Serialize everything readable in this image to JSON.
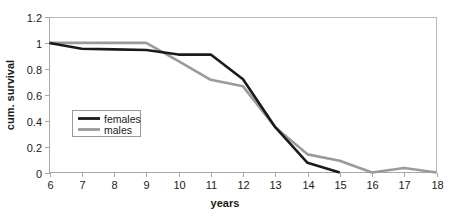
{
  "chart_data": {
    "type": "line",
    "title": "",
    "xlabel": "years",
    "ylabel": "cum. survival",
    "xlim": [
      6,
      18
    ],
    "ylim": [
      0,
      1.2
    ],
    "grid": false,
    "legend_position": "inside-left",
    "x_ticks": [
      "6",
      "7",
      "8",
      "9",
      "10",
      "11",
      "12",
      "13",
      "14",
      "15",
      "16",
      "17",
      "18"
    ],
    "y_ticks": [
      "0",
      "0.2",
      "0.4",
      "0.6",
      "0.8",
      "1",
      "1.2"
    ],
    "x": [
      6,
      7,
      8,
      9,
      10,
      11,
      12,
      13,
      14,
      15,
      16,
      17,
      18
    ],
    "series": [
      {
        "name": "females",
        "color": "#1a1a1a",
        "x": [
          6,
          7,
          8,
          9,
          10,
          11,
          12,
          13,
          14,
          15
        ],
        "values": [
          1.0,
          0.955,
          0.95,
          0.945,
          0.91,
          0.91,
          0.72,
          0.35,
          0.075,
          0.0
        ]
      },
      {
        "name": "males",
        "color": "#9a9a9a",
        "x": [
          6,
          7,
          8,
          9,
          10,
          11,
          12,
          13,
          14,
          15,
          16,
          17,
          18
        ],
        "values": [
          1.0,
          1.0,
          1.0,
          1.0,
          0.86,
          0.715,
          0.665,
          0.35,
          0.14,
          0.09,
          0.0,
          0.035,
          0.0
        ]
      }
    ]
  },
  "legend": {
    "entries": [
      {
        "label": "females",
        "color": "#1a1a1a"
      },
      {
        "label": "males",
        "color": "#9a9a9a"
      }
    ]
  },
  "axes": {
    "x_title": "years",
    "y_title": "cum. survival"
  },
  "colors": {
    "females": "#1a1a1a",
    "males": "#9a9a9a",
    "frame": "#b9b9b9",
    "axis": "#a8a8a8",
    "text": "#1a1a1a",
    "background": "#ffffff"
  }
}
